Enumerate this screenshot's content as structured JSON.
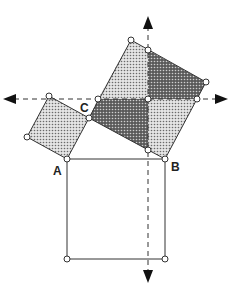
{
  "diagram": {
    "labels": {
      "A": "A",
      "B": "B",
      "C": "C"
    },
    "points": {
      "A": [
        67,
        159
      ],
      "B": [
        165,
        159
      ],
      "C": [
        89,
        118
      ]
    },
    "colors": {
      "light_fill": "#c8c8c8",
      "dark_fill": "#6e6e6e",
      "stroke": "#333333",
      "axis": "#333333"
    },
    "shapes": [
      {
        "name": "small-square-on-AC",
        "fill": "light"
      },
      {
        "name": "large-square-on-BC",
        "fill": "mixed",
        "pieces": 4
      },
      {
        "name": "square-on-AB",
        "fill": "none"
      }
    ],
    "axes": [
      {
        "name": "horizontal-dashed-axis",
        "direction": "both"
      },
      {
        "name": "vertical-dashed-axis",
        "direction": "both"
      }
    ]
  }
}
